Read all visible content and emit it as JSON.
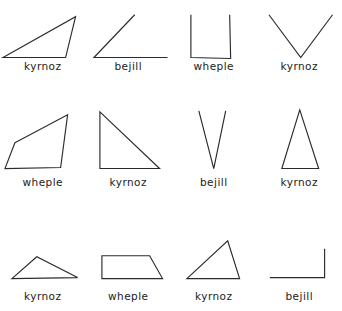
{
  "sheet": {
    "title": "shape-label-sheet",
    "background_color": "#ffffff",
    "stroke_color": "#2b2b2b",
    "label_color": "#222222",
    "columns": 4,
    "rows": 3
  },
  "shapes": [
    {
      "id": "r1c1",
      "label": "kyrnoz",
      "kind": "triangle",
      "description": "obtuse scalene triangle, apex upper right, clipped at top",
      "geometry": "polygon",
      "points": "3,43 76,2 66,43",
      "viewbox": "0 0 86 46"
    },
    {
      "id": "r1c2",
      "label": "bejill",
      "kind": "angle",
      "description": "open angle, two rays from lower-left vertex, clipped at top",
      "geometry": "polyline",
      "points": "49,0 8,43 82,43",
      "viewbox": "0 0 86 46"
    },
    {
      "id": "r1c3",
      "label": "wheple",
      "kind": "quadrilateral",
      "description": "upright rectangle-like quadrilateral, clipped at top",
      "geometry": "polyline",
      "points": "20,0 20,43 60,44 59,0",
      "viewbox": "0 0 86 46"
    },
    {
      "id": "r1c4",
      "label": "kyrnoz",
      "kind": "triangle",
      "description": "inverted V triangle, vertex at bottom, clipped at top",
      "geometry": "polyline",
      "points": "12,0 44,43 76,0",
      "viewbox": "0 0 86 46"
    },
    {
      "id": "r2c1",
      "label": "wheple",
      "kind": "quadrilateral",
      "description": "irregular quadrilateral leaning right",
      "geometry": "polygon",
      "points": "15,38 68,10 61,63 5,64",
      "viewbox": "0 0 86 72"
    },
    {
      "id": "r2c2",
      "label": "kyrnoz",
      "kind": "triangle",
      "description": "right triangle, right angle at lower left",
      "geometry": "polygon",
      "points": "14,7 74,64 14,64",
      "viewbox": "0 0 86 72"
    },
    {
      "id": "r2c3",
      "label": "bejill",
      "kind": "angle",
      "description": "narrow acute V angle, vertex at bottom",
      "geometry": "polyline",
      "points": "28,6 43,64 55,6",
      "viewbox": "0 0 86 72"
    },
    {
      "id": "r2c4",
      "label": "kyrnoz",
      "kind": "triangle",
      "description": "tall narrow isosceles triangle",
      "geometry": "polygon",
      "points": "43,5 62,64 25,64",
      "viewbox": "0 0 86 72"
    },
    {
      "id": "r3c1",
      "label": "kyrnoz",
      "kind": "triangle",
      "description": "flat obtuse triangle, low apex left of centre",
      "geometry": "polygon",
      "points": "12,60 37,38 78,59",
      "viewbox": "0 0 86 72"
    },
    {
      "id": "r3c2",
      "label": "wheple",
      "kind": "quadrilateral",
      "description": "right trapezoid, slanted right edge",
      "geometry": "polygon",
      "points": "16,37 64,37 77,60 16,60",
      "viewbox": "0 0 86 72"
    },
    {
      "id": "r3c3",
      "label": "kyrnoz",
      "kind": "triangle",
      "description": "scalene triangle, apex upper right",
      "geometry": "polygon",
      "points": "57,22 69,60 16,60",
      "viewbox": "0 0 86 72"
    },
    {
      "id": "r3c4",
      "label": "bejill",
      "kind": "angle",
      "description": "right angle corner opening to upper left",
      "geometry": "polyline",
      "points": "13,59 68,59 68,30",
      "viewbox": "0 0 86 72"
    }
  ]
}
